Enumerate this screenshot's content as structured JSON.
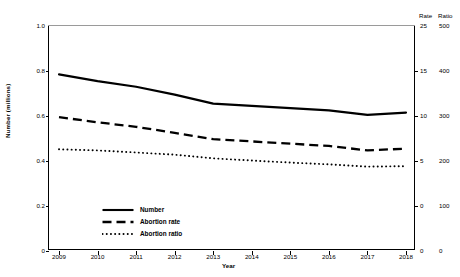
{
  "chart_data": {
    "type": "line",
    "title": "",
    "xlabel": "Year",
    "ylabel": "Number (millions)",
    "x": [
      2009,
      2010,
      2011,
      2012,
      2013,
      2014,
      2015,
      2016,
      2017,
      2018
    ],
    "xtick_labels": [
      "2009",
      "2010",
      "2011",
      "2012",
      "2013",
      "2014",
      "2015",
      "2016",
      "2017",
      "2018"
    ],
    "ylim": [
      0,
      1.0
    ],
    "ytick_values": [
      0,
      0.2,
      0.4,
      0.6,
      0.8,
      1.0
    ],
    "ytick_labels": [
      "0",
      "0.2",
      "0.4",
      "0.6",
      "0.8",
      "1.0"
    ],
    "grid": false,
    "legend_position": "lower-left-inside",
    "secondary_axes": [
      {
        "name": "Rate",
        "header": "Rate",
        "tick_labels": [
          "25",
          "15",
          "10",
          "5",
          "0",
          "0"
        ],
        "tick_positions_left_scale": [
          1.0,
          0.8,
          0.6,
          0.4,
          0.2,
          0.0
        ]
      },
      {
        "name": "Ratio",
        "header": "Ratio",
        "tick_labels": [
          "500",
          "400",
          "300",
          "200",
          "100",
          "0"
        ],
        "tick_positions_left_scale": [
          1.0,
          0.8,
          0.6,
          0.4,
          0.2,
          0.0
        ]
      }
    ],
    "series": [
      {
        "name": "Number",
        "style": "solid",
        "axis": "left",
        "unit": "millions",
        "values": [
          0.785,
          0.755,
          0.73,
          0.695,
          0.655,
          0.645,
          0.635,
          0.625,
          0.605,
          0.615
        ]
      },
      {
        "name": "Abortion rate",
        "style": "dashed",
        "axis": "rate",
        "values_left_scale": [
          0.595,
          0.572,
          0.552,
          0.525,
          0.497,
          0.487,
          0.477,
          0.467,
          0.447,
          0.455
        ],
        "values": [
          14.6,
          13.9,
          13.3,
          12.5,
          11.7,
          11.4,
          11.1,
          10.8,
          10.2,
          10.4
        ]
      },
      {
        "name": "Abortion ratio",
        "style": "dotted",
        "axis": "ratio",
        "values_left_scale": [
          0.452,
          0.447,
          0.438,
          0.428,
          0.412,
          0.402,
          0.393,
          0.385,
          0.375,
          0.377
        ],
        "values": [
          226,
          224,
          219,
          214,
          206,
          201,
          196,
          193,
          188,
          189
        ]
      }
    ]
  },
  "axes": {
    "y_label": "Number (millions)",
    "x_label": "Year",
    "rate_header": "Rate",
    "ratio_header": "Ratio"
  },
  "legend": {
    "items": [
      {
        "label": "Number",
        "style": "solid"
      },
      {
        "label": "Abortion rate",
        "style": "dashed"
      },
      {
        "label": "Abortion ratio",
        "style": "dotted"
      }
    ]
  },
  "caption": {
    "text": ""
  },
  "colors": {
    "line": "#000000",
    "frame": "#000000",
    "frame_top": "#9a9a9a",
    "background": "#ffffff"
  }
}
